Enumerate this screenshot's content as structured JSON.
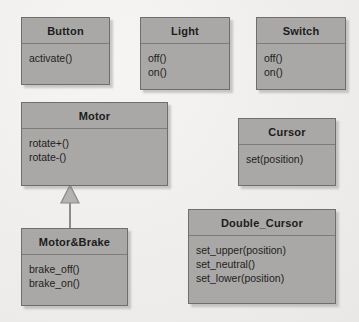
{
  "diagram": {
    "background_color": "#f3f1f0",
    "box_fill_color": "#a9a8a6",
    "box_border_color": "#6f6e6c",
    "classes": [
      {
        "name": "Button",
        "operations": [
          "activate()"
        ],
        "x": 21,
        "y": 17,
        "w": 89,
        "h": 68
      },
      {
        "name": "Light",
        "operations": [
          "off()",
          "on()"
        ],
        "x": 140,
        "y": 17,
        "w": 90,
        "h": 73
      },
      {
        "name": "Switch",
        "operations": [
          "off()",
          "on()"
        ],
        "x": 256,
        "y": 17,
        "w": 90,
        "h": 73
      },
      {
        "name": "Motor",
        "operations": [
          "rotate+()",
          "rotate-()"
        ],
        "x": 21,
        "y": 102,
        "w": 147,
        "h": 84
      },
      {
        "name": "Cursor",
        "operations": [
          "set(position)"
        ],
        "x": 238,
        "y": 118,
        "w": 98,
        "h": 68
      },
      {
        "name": "Motor&Brake",
        "operations": [
          "brake_off()",
          "brake_on()"
        ],
        "x": 21,
        "y": 228,
        "w": 107,
        "h": 78
      },
      {
        "name": "Double_Cursor",
        "operations": [
          "set_upper(position)",
          "set_neutral()",
          "set_lower(position)"
        ],
        "x": 188,
        "y": 209,
        "w": 148,
        "h": 95
      }
    ],
    "relationships": [
      {
        "type": "generalization",
        "from": "Motor&Brake",
        "to": "Motor",
        "arrow": "hollow-triangle"
      }
    ]
  }
}
